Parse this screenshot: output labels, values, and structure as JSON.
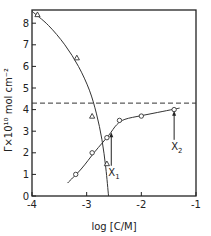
{
  "chart_data": {
    "type": "scatter",
    "title": "",
    "xlabel": "log [C/M]",
    "ylabel": "Γ×10¹⁰ mol cm⁻²",
    "xlim": [
      -4,
      -1
    ],
    "ylim": [
      0,
      8.6
    ],
    "x_ticks": [
      -4,
      -3,
      -2,
      -1
    ],
    "x_tick_labels": [
      "-4",
      "-3",
      "-2",
      "-1"
    ],
    "y_ticks": [
      0,
      1,
      2,
      3,
      4,
      5,
      6,
      7,
      8
    ],
    "y_tick_labels": [
      "0",
      "1",
      "2",
      "3",
      "4",
      "5",
      "6",
      "7",
      "8"
    ],
    "grid": false,
    "legend": null,
    "series": [
      {
        "name": "triangles",
        "marker": "triangle",
        "points": [
          [
            -3.9,
            8.4
          ],
          [
            -3.18,
            6.4
          ],
          [
            -2.9,
            3.7
          ],
          [
            -2.63,
            1.5
          ]
        ],
        "curve": [
          [
            -4.0,
            8.55
          ],
          [
            -3.7,
            7.9
          ],
          [
            -3.4,
            7.0
          ],
          [
            -3.15,
            6.0
          ],
          [
            -2.95,
            4.9
          ],
          [
            -2.82,
            3.8
          ],
          [
            -2.72,
            2.6
          ],
          [
            -2.65,
            1.3
          ],
          [
            -2.6,
            0.0
          ]
        ]
      },
      {
        "name": "circles",
        "marker": "circle",
        "points": [
          [
            -3.2,
            1.0
          ],
          [
            -2.9,
            2.0
          ],
          [
            -2.63,
            2.7
          ],
          [
            -2.4,
            3.5
          ],
          [
            -2.0,
            3.7
          ],
          [
            -1.4,
            4.0
          ]
        ],
        "curve": [
          [
            -3.35,
            0.6
          ],
          [
            -3.1,
            1.25
          ],
          [
            -2.85,
            2.05
          ],
          [
            -2.6,
            2.8
          ],
          [
            -2.45,
            3.3
          ],
          [
            -2.3,
            3.55
          ],
          [
            -2.0,
            3.72
          ],
          [
            -1.7,
            3.87
          ],
          [
            -1.4,
            4.02
          ],
          [
            -1.3,
            4.07
          ]
        ]
      }
    ],
    "reference_line": {
      "type": "horizontal-dashed",
      "y": 4.3
    },
    "annotations": [
      {
        "text": "X",
        "subscript": "1",
        "arrow_x": -2.55,
        "arrow_from_y": 1.4,
        "arrow_to_y": 2.95
      },
      {
        "text": "X",
        "subscript": "2",
        "arrow_x": -1.4,
        "arrow_from_y": 2.6,
        "arrow_to_y": 3.95
      }
    ]
  }
}
